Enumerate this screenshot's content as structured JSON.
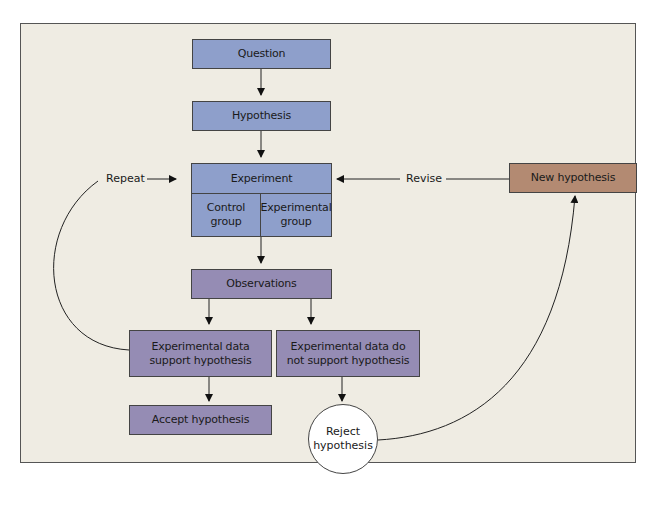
{
  "diagram": {
    "colors": {
      "background": "#efece3",
      "blue_box": "#8e9fcb",
      "purple_box": "#958cb4",
      "brown_box": "#b38a72",
      "circle": "#ffffff",
      "stroke": "#222222"
    },
    "nodes": {
      "question": "Question",
      "hypothesis": "Hypothesis",
      "experiment": "Experiment",
      "control_group": "Control group",
      "experimental_group": "Experimental group",
      "observations": "Observations",
      "support": "Experimental data support hypothesis",
      "not_support": "Experimental data do not support hypothesis",
      "accept": "Accept hypothesis",
      "reject": "Reject hypothesis",
      "new_hypothesis": "New hypothesis"
    },
    "edge_labels": {
      "repeat": "Repeat",
      "revise": "Revise"
    },
    "edges": [
      {
        "from": "Question",
        "to": "Hypothesis"
      },
      {
        "from": "Hypothesis",
        "to": "Experiment"
      },
      {
        "from": "Experiment",
        "to": "Observations"
      },
      {
        "from": "Observations",
        "to": "Experimental data support hypothesis"
      },
      {
        "from": "Observations",
        "to": "Experimental data do not support hypothesis"
      },
      {
        "from": "Experimental data support hypothesis",
        "to": "Accept hypothesis"
      },
      {
        "from": "Experimental data do not support hypothesis",
        "to": "Reject hypothesis"
      },
      {
        "from": "Experimental data support hypothesis",
        "to": "Experiment",
        "label": "Repeat"
      },
      {
        "from": "Reject hypothesis",
        "to": "New hypothesis"
      },
      {
        "from": "New hypothesis",
        "to": "Experiment",
        "label": "Revise"
      }
    ]
  }
}
